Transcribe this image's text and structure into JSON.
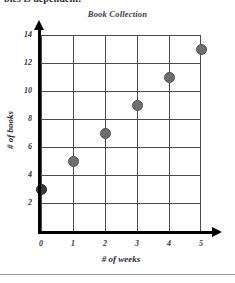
{
  "header": {
    "cropped_text": "bles is dependent."
  },
  "chart_data": {
    "type": "scatter",
    "title": "Book Collection",
    "xlabel": "# of weeks",
    "ylabel": "# of books",
    "x": [
      0,
      1,
      2,
      3,
      4,
      5
    ],
    "values": [
      3,
      5,
      7,
      9,
      11,
      13
    ],
    "points": [
      {
        "x": 0,
        "y": 3
      },
      {
        "x": 1,
        "y": 5
      },
      {
        "x": 2,
        "y": 7
      },
      {
        "x": 3,
        "y": 9
      },
      {
        "x": 4,
        "y": 11
      },
      {
        "x": 5,
        "y": 13
      }
    ],
    "xlim": [
      0,
      5
    ],
    "ylim": [
      0,
      14
    ],
    "xticks": [
      "0",
      "1",
      "2",
      "3",
      "4",
      "5"
    ],
    "yticks": [
      "2",
      "4",
      "6",
      "8",
      "10",
      "12",
      "14"
    ],
    "grid": true,
    "legend": null,
    "marker_color": "#6e6e6e",
    "axis_color": "#000000",
    "grid_color": "#4a4a4a"
  }
}
